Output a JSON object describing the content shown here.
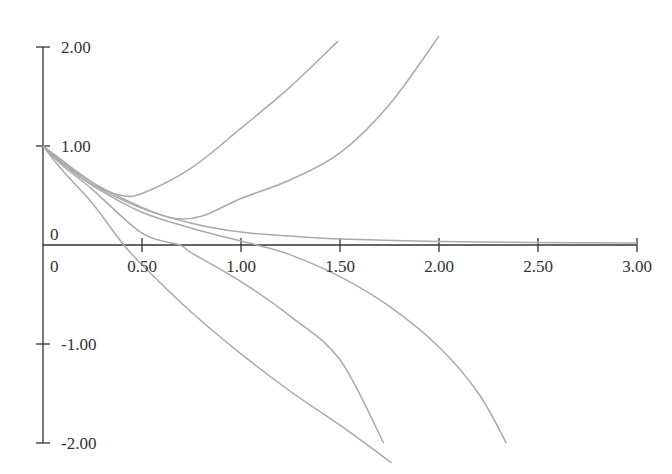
{
  "chart_data": {
    "type": "line",
    "title": "",
    "xlabel": "",
    "ylabel": "",
    "xlim": [
      0,
      3.0
    ],
    "ylim": [
      -2.0,
      2.0
    ],
    "grid": false,
    "legend": null,
    "x_ticks": [
      "0",
      "0.50",
      "1.00",
      "1.50",
      "2.00",
      "2.50",
      "3.00"
    ],
    "x_tick_values": [
      0,
      0.5,
      1.0,
      1.5,
      2.0,
      2.5,
      3.0
    ],
    "y_ticks": [
      "2.00",
      "1.00",
      "0",
      "-1.00",
      "-2.00"
    ],
    "y_tick_values": [
      2.0,
      1.0,
      0,
      -1.0,
      -2.0
    ],
    "series": [
      {
        "name": "curve-1",
        "points": [
          [
            0,
            1
          ],
          [
            0.1,
            0.85
          ],
          [
            0.2,
            0.7
          ],
          [
            0.3,
            0.57
          ],
          [
            0.4,
            0.5
          ],
          [
            0.5,
            0.52
          ],
          [
            0.75,
            0.78
          ],
          [
            1.0,
            1.18
          ],
          [
            1.25,
            1.6
          ],
          [
            1.49,
            2.06
          ]
        ]
      },
      {
        "name": "curve-2",
        "points": [
          [
            0,
            1
          ],
          [
            0.1,
            0.83
          ],
          [
            0.25,
            0.63
          ],
          [
            0.5,
            0.38
          ],
          [
            0.66,
            0.27
          ],
          [
            0.8,
            0.29
          ],
          [
            1.0,
            0.47
          ],
          [
            1.25,
            0.66
          ],
          [
            1.5,
            0.93
          ],
          [
            1.75,
            1.42
          ],
          [
            2.0,
            2.11
          ]
        ]
      },
      {
        "name": "curve-3",
        "points": [
          [
            0,
            1
          ],
          [
            0.1,
            0.82
          ],
          [
            0.25,
            0.61
          ],
          [
            0.5,
            0.37
          ],
          [
            0.75,
            0.22
          ],
          [
            1.0,
            0.13
          ],
          [
            1.25,
            0.09
          ],
          [
            1.5,
            0.06
          ],
          [
            2.0,
            0.035
          ],
          [
            2.5,
            0.025
          ],
          [
            3.0,
            0.02
          ]
        ]
      },
      {
        "name": "curve-4",
        "points": [
          [
            0,
            1
          ],
          [
            0.1,
            0.82
          ],
          [
            0.25,
            0.6
          ],
          [
            0.5,
            0.33
          ],
          [
            0.75,
            0.17
          ],
          [
            1.0,
            0.04
          ],
          [
            1.08,
            0
          ],
          [
            1.25,
            -0.1
          ],
          [
            1.5,
            -0.32
          ],
          [
            1.75,
            -0.62
          ],
          [
            2.0,
            -1.03
          ],
          [
            2.2,
            -1.5
          ],
          [
            2.34,
            -2.0
          ]
        ]
      },
      {
        "name": "curve-5",
        "points": [
          [
            0,
            1
          ],
          [
            0.1,
            0.8
          ],
          [
            0.25,
            0.56
          ],
          [
            0.5,
            0.12
          ],
          [
            0.69,
            0
          ],
          [
            0.75,
            -0.08
          ],
          [
            1.0,
            -0.37
          ],
          [
            1.25,
            -0.72
          ],
          [
            1.5,
            -1.16
          ],
          [
            1.72,
            -2.0
          ]
        ]
      },
      {
        "name": "curve-6",
        "points": [
          [
            0,
            1
          ],
          [
            0.1,
            0.75
          ],
          [
            0.25,
            0.42
          ],
          [
            0.4,
            0.02
          ],
          [
            0.5,
            -0.2
          ],
          [
            0.75,
            -0.68
          ],
          [
            1.0,
            -1.1
          ],
          [
            1.25,
            -1.48
          ],
          [
            1.5,
            -1.82
          ],
          [
            1.76,
            -2.2
          ]
        ]
      }
    ]
  },
  "colors": {
    "axis": "#333333",
    "curve": "#aaaaaa",
    "background": "#ffffff"
  },
  "labels": {
    "origin_y": "0",
    "origin_x": "0"
  }
}
